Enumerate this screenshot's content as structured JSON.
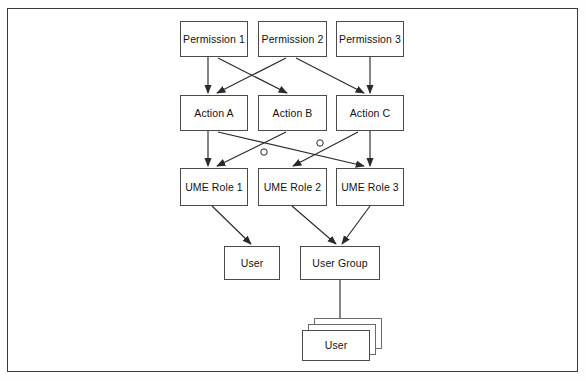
{
  "diagram": {
    "type": "flow-diagram",
    "background_color": "#ffffff",
    "frame_color": "#3a3a3a",
    "box_border_color": "#4a4a4a",
    "arrow_color": "#2a2a2a",
    "text_color": "#121212",
    "rows": [
      {
        "name": "permissions",
        "nodes": [
          {
            "id": "perm1",
            "label": "Permission 1",
            "x": 180,
            "y": 21,
            "w": 68,
            "h": 36
          },
          {
            "id": "perm2",
            "label": "Permission 2",
            "x": 258,
            "y": 21,
            "w": 69,
            "h": 36
          },
          {
            "id": "perm3",
            "label": "Permission 3",
            "x": 336,
            "y": 21,
            "w": 68,
            "h": 36
          }
        ]
      },
      {
        "name": "actions",
        "nodes": [
          {
            "id": "actA",
            "label": "Action A",
            "x": 180,
            "y": 95,
            "w": 68,
            "h": 36
          },
          {
            "id": "actB",
            "label": "Action B",
            "x": 258,
            "y": 95,
            "w": 69,
            "h": 36
          },
          {
            "id": "actC",
            "label": "Action C",
            "x": 336,
            "y": 95,
            "w": 68,
            "h": 36
          }
        ]
      },
      {
        "name": "ume_roles",
        "nodes": [
          {
            "id": "role1",
            "label": "UME Role 1",
            "x": 180,
            "y": 168,
            "w": 68,
            "h": 38
          },
          {
            "id": "role2",
            "label": "UME Role 2",
            "x": 258,
            "y": 168,
            "w": 69,
            "h": 38
          },
          {
            "id": "role3",
            "label": "UME Role 3",
            "x": 336,
            "y": 168,
            "w": 68,
            "h": 38
          }
        ]
      },
      {
        "name": "consumers",
        "nodes": [
          {
            "id": "user",
            "label": "User",
            "x": 224,
            "y": 246,
            "w": 56,
            "h": 34
          },
          {
            "id": "usergroup",
            "label": "User Group",
            "x": 300,
            "y": 246,
            "w": 80,
            "h": 34
          }
        ]
      },
      {
        "name": "user_stack",
        "nodes": [
          {
            "id": "userstack",
            "label": "User",
            "x": 302,
            "y": 330,
            "w": 68,
            "h": 31,
            "stacked": true,
            "stack_count": 3
          }
        ]
      }
    ],
    "edges": [
      {
        "from": "perm1",
        "to": "actA",
        "kind": "vertical"
      },
      {
        "from": "perm1",
        "to": "actB",
        "kind": "diagonal"
      },
      {
        "from": "perm2",
        "to": "actA",
        "kind": "diagonal"
      },
      {
        "from": "perm2",
        "to": "actC",
        "kind": "diagonal"
      },
      {
        "from": "perm3",
        "to": "actC",
        "kind": "vertical"
      },
      {
        "from": "actA",
        "to": "role1",
        "kind": "vertical"
      },
      {
        "from": "actA",
        "to": "role3",
        "kind": "diagonal"
      },
      {
        "from": "actB",
        "to": "role1",
        "kind": "diagonal"
      },
      {
        "from": "actC",
        "to": "role2",
        "kind": "diagonal"
      },
      {
        "from": "actC",
        "to": "role3",
        "kind": "vertical"
      },
      {
        "from": "role1",
        "to": "user",
        "kind": "diagonal"
      },
      {
        "from": "role2",
        "to": "usergroup",
        "kind": "diagonal"
      },
      {
        "from": "role3",
        "to": "usergroup",
        "kind": "diagonal"
      },
      {
        "from": "usergroup",
        "to": "userstack",
        "kind": "vertical"
      }
    ],
    "crossing_hops": [
      {
        "x": 264,
        "y": 152
      },
      {
        "x": 320,
        "y": 143
      }
    ]
  }
}
